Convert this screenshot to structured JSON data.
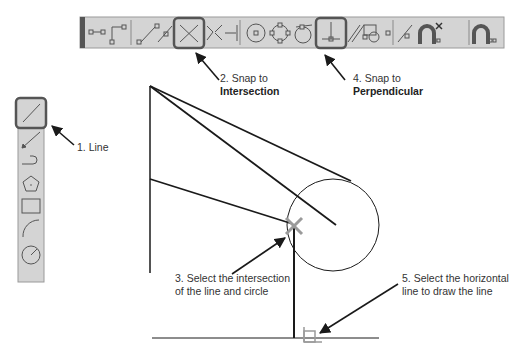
{
  "toolbar": {
    "background": "#d4d4d4",
    "highlight_color": "#555555",
    "tools": [
      {
        "name": "endpoint-snap"
      },
      {
        "name": "end-point-of-line"
      },
      {
        "name": "midpoint-snap"
      },
      {
        "name": "point-on-line"
      },
      {
        "name": "intersection-snap",
        "highlighted": true
      },
      {
        "name": "apparent-intersection"
      },
      {
        "name": "extension"
      },
      {
        "name": "center-snap"
      },
      {
        "name": "quadrant-snap"
      },
      {
        "name": "tangent-snap"
      },
      {
        "name": "perpendicular-snap",
        "highlighted": true
      },
      {
        "name": "parallel-snap"
      },
      {
        "name": "insertion-snap"
      },
      {
        "name": "node-snap"
      },
      {
        "name": "nearest-snap"
      },
      {
        "name": "none-snap"
      },
      {
        "name": "osnap-settings"
      }
    ]
  },
  "draw_toolbar": {
    "tools": [
      {
        "name": "line",
        "highlighted": true
      },
      {
        "name": "construction-line"
      },
      {
        "name": "polyline"
      },
      {
        "name": "polygon"
      },
      {
        "name": "rectangle"
      },
      {
        "name": "arc"
      },
      {
        "name": "circle"
      }
    ]
  },
  "callouts": {
    "step1": "1. Line",
    "step2_line1": "2. Snap to",
    "step2_line2": "Intersection",
    "step3_line1": "3. Select the intersection",
    "step3_line2": "of the line and circle",
    "step4_line1": "4. Snap to",
    "step4_line2": "Perpendicular",
    "step5_line1": "5. Select the horizontal",
    "step5_line2": "line to draw the line"
  },
  "colors": {
    "drawing_line": "#1a1a1a",
    "marker": "#9a9a9a",
    "text": "#333333"
  }
}
